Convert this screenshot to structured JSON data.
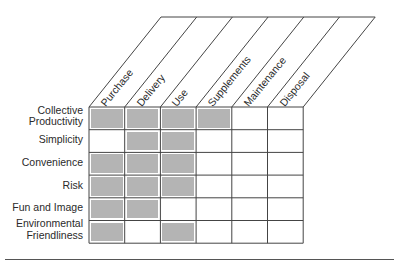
{
  "diagram": {
    "columns": [
      "Purchase",
      "Delivery",
      "Use",
      "Supplements",
      "Maintenance",
      "Disposal"
    ],
    "rows": [
      {
        "label": [
          "Collective",
          "Productivity"
        ],
        "cells": [
          1,
          1,
          1,
          1,
          0,
          0
        ]
      },
      {
        "label": [
          "Simplicity"
        ],
        "cells": [
          0,
          1,
          1,
          0,
          0,
          0
        ]
      },
      {
        "label": [
          "Convenience"
        ],
        "cells": [
          1,
          1,
          1,
          0,
          0,
          0
        ]
      },
      {
        "label": [
          "Risk"
        ],
        "cells": [
          1,
          1,
          1,
          0,
          0,
          0
        ]
      },
      {
        "label": [
          "Fun and Image"
        ],
        "cells": [
          1,
          1,
          0,
          0,
          0,
          0
        ]
      },
      {
        "label": [
          "Environmental",
          "Friendliness"
        ],
        "cells": [
          1,
          0,
          1,
          0,
          0,
          0
        ]
      }
    ],
    "colors": {
      "fill": "#b4b4b4",
      "line": "#444444"
    }
  }
}
